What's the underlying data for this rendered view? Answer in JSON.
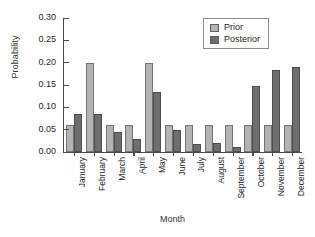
{
  "chart_data": {
    "type": "bar",
    "title": "",
    "xlabel": "Month",
    "ylabel": "Probability",
    "categories": [
      "January",
      "February",
      "March",
      "April",
      "May",
      "June",
      "July",
      "August",
      "September",
      "October",
      "November",
      "December"
    ],
    "series": [
      {
        "name": "Prior",
        "color": "#b3b3b3",
        "values": [
          0.06,
          0.2,
          0.06,
          0.06,
          0.2,
          0.06,
          0.06,
          0.06,
          0.06,
          0.06,
          0.06,
          0.06
        ]
      },
      {
        "name": "Posterior",
        "color": "#6e6e6e",
        "values": [
          0.085,
          0.085,
          0.045,
          0.03,
          0.135,
          0.05,
          0.017,
          0.021,
          0.012,
          0.148,
          0.183,
          0.19
        ]
      }
    ],
    "ylim": [
      0.0,
      0.3
    ],
    "yticks": [
      0.0,
      0.05,
      0.1,
      0.15,
      0.2,
      0.25,
      0.3
    ],
    "ytick_labels": [
      "0.00",
      "0.05",
      "0.10",
      "0.15",
      "0.20",
      "0.25",
      "0.30"
    ],
    "grid": false,
    "legend_position": "top-right",
    "legend_entries": [
      "Prior",
      "Posterior"
    ]
  }
}
